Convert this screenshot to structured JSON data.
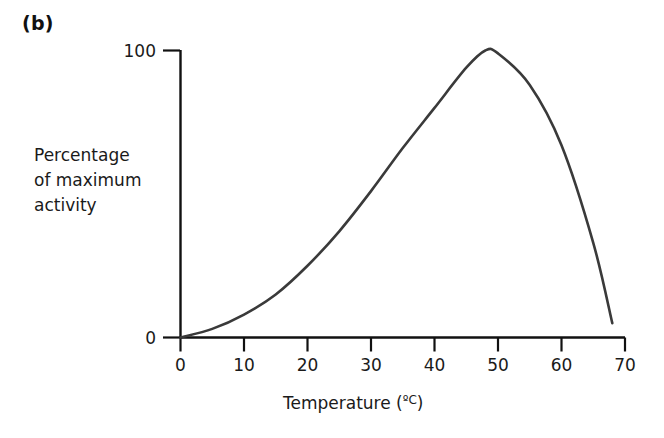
{
  "panel": {
    "label": "(b)"
  },
  "chart_data": {
    "type": "line",
    "title": "",
    "panel_label": "(b)",
    "xlabel": "Temperature (ºC)",
    "xlabel_text": "Temperature (",
    "xlabel_unit": "ºC",
    "xlabel_close": ")",
    "ylabel_lines": [
      "Percentage",
      "of maximum",
      "activity"
    ],
    "ylabel": "Percentage of maximum activity",
    "xlim": [
      0,
      70
    ],
    "ylim": [
      0,
      100
    ],
    "xticks": [
      0,
      10,
      20,
      30,
      40,
      50,
      60,
      70
    ],
    "xtick_labels": [
      "0",
      "10",
      "20",
      "30",
      "40",
      "50",
      "60",
      "70"
    ],
    "yticks": [
      0,
      100
    ],
    "ytick_labels": [
      "0",
      "100"
    ],
    "grid": false,
    "legend": false,
    "line_color": "#3a3a3a",
    "axis_color": "#111111",
    "x": [
      0,
      5,
      10,
      15,
      20,
      25,
      30,
      35,
      40,
      45,
      48,
      50,
      55,
      60,
      65,
      68
    ],
    "y": [
      0,
      3,
      8,
      15,
      25,
      37,
      51,
      66,
      80,
      94,
      100,
      99,
      88,
      67,
      33,
      5
    ],
    "series": [
      {
        "name": "Enzyme activity",
        "x": [
          0,
          5,
          10,
          15,
          20,
          25,
          30,
          35,
          40,
          45,
          48,
          50,
          55,
          60,
          65,
          68
        ],
        "values": [
          0,
          3,
          8,
          15,
          25,
          37,
          51,
          66,
          80,
          94,
          100,
          99,
          88,
          67,
          33,
          5
        ]
      }
    ],
    "peak": {
      "x": 48,
      "y": 100
    }
  }
}
